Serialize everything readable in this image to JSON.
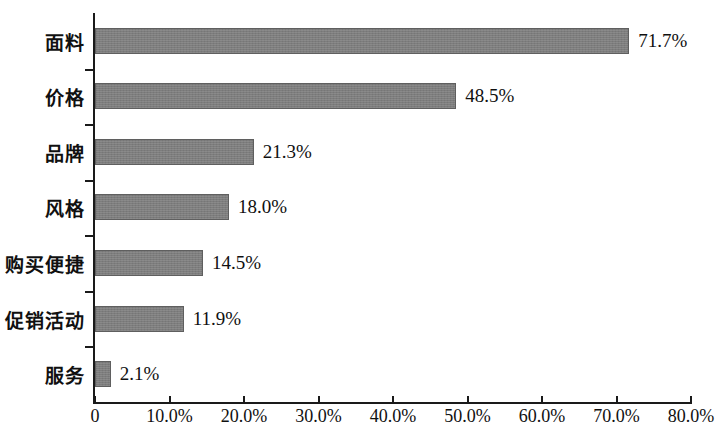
{
  "chart_data": {
    "type": "bar",
    "orientation": "horizontal",
    "title": "",
    "xlabel": "",
    "ylabel": "",
    "categories": [
      "面料",
      "价格",
      "品牌",
      "风格",
      "购买便捷",
      "促销活动",
      "服务"
    ],
    "values": [
      71.7,
      48.5,
      21.3,
      18.0,
      14.5,
      11.9,
      2.1
    ],
    "value_labels": [
      "71.7%",
      "48.5%",
      "21.3%",
      "18.0%",
      "14.5%",
      "11.9%",
      "2.1%"
    ],
    "xlim": [
      0,
      80
    ],
    "xticks": [
      0,
      10,
      20,
      30,
      40,
      50,
      60,
      70,
      80
    ],
    "xtick_labels": [
      "0",
      "10.0%",
      "20.0%",
      "30.0%",
      "40.0%",
      "50.0%",
      "60.0%",
      "70.0%",
      "80.0%"
    ],
    "grid": false,
    "legend": false,
    "bar_color": "#7d7d7d",
    "axis_color": "#1a1a1a",
    "background": "#ffffff"
  }
}
